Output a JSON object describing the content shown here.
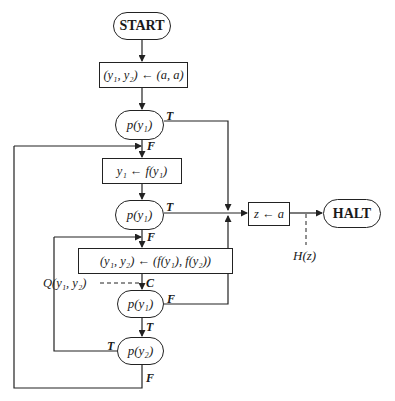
{
  "diagram": {
    "type": "flowchart",
    "nodes": {
      "start": "START",
      "init": "(y₁, y₂) ← (a, a)",
      "test1": "p(y₁)",
      "step1": "y₁ ← f(y₁)",
      "test2": "p(y₁)",
      "assign_z": "z ← a",
      "halt": "HALT",
      "step2": "(y₁, y₂) ← (f(y₁), f(y₂))",
      "test3": "p(y₁)",
      "test4": "p(y₂)"
    },
    "edge_labels": {
      "test1_true": "T",
      "test1_false": "F",
      "test2_true": "T",
      "test2_false": "F",
      "cut_point": "C",
      "test3_false": "F",
      "test3_true": "T",
      "test4_true": "T",
      "test4_false": "F"
    },
    "annotations": {
      "invariant": "Q(y₁, y₂)",
      "halt_assertion": "H(z)"
    }
  }
}
